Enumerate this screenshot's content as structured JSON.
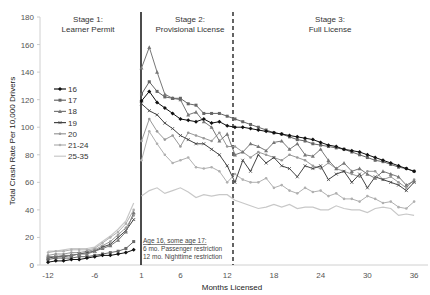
{
  "chart_data": {
    "type": "line",
    "title": "",
    "xlabel": "Months Licensed",
    "ylabel": "Total Crash Rate Per 10,000 Drivers",
    "ylim": [
      0,
      180
    ],
    "yticks": [
      0,
      20,
      40,
      60,
      80,
      100,
      120,
      140,
      160,
      180
    ],
    "xtick_labels": [
      "-12",
      "-6",
      "1",
      "6",
      "12",
      "18",
      "24",
      "30",
      "36"
    ],
    "grid": false,
    "legend_position": "upper-left-inside",
    "x": [
      -12,
      -11,
      -10,
      -9,
      -8,
      -7,
      -6,
      -5,
      -4,
      -3,
      -2,
      -1,
      1,
      2,
      3,
      4,
      5,
      6,
      7,
      8,
      9,
      10,
      11,
      12,
      13,
      14,
      15,
      16,
      17,
      18,
      19,
      20,
      21,
      22,
      23,
      24,
      25,
      26,
      27,
      28,
      29,
      30,
      31,
      32,
      33,
      34,
      35,
      36
    ],
    "stages": [
      {
        "label_line1": "Stage 1:",
        "label_line2": "Learner Permit"
      },
      {
        "label_line1": "Stage 2:",
        "label_line2": "Provisional License"
      },
      {
        "label_line1": "Stage 3:",
        "label_line2": "Full License"
      }
    ],
    "annotation": {
      "line1": "Age 16, some age 17:",
      "line2": "6 mo. Passenger restriction",
      "line3": "12 mo. Nighttime restriction"
    },
    "series": [
      {
        "name": "16",
        "color": "#111111",
        "marker": "diamond",
        "values": [
          2,
          3,
          3,
          4,
          4,
          5,
          6,
          7,
          7,
          8,
          9,
          11,
          119,
          126,
          118,
          114,
          110,
          106,
          105,
          104,
          106,
          103,
          104,
          101,
          100,
          100,
          99,
          98,
          97,
          96,
          95,
          94,
          93,
          92,
          91,
          89,
          87,
          86,
          84,
          83,
          82,
          80,
          78,
          76,
          74,
          72,
          70,
          68
        ]
      },
      {
        "name": "17",
        "color": "#666666",
        "marker": "square",
        "values": [
          4,
          5,
          5,
          5,
          6,
          6,
          7,
          8,
          9,
          10,
          12,
          17,
          124,
          133,
          126,
          122,
          121,
          121,
          117,
          116,
          110,
          110,
          110,
          108,
          106,
          104,
          102,
          100,
          98,
          96,
          95,
          93,
          91,
          90,
          88,
          87,
          86,
          85,
          84,
          82,
          80,
          78,
          76,
          75,
          73,
          71,
          70,
          68
        ]
      },
      {
        "name": "18",
        "color": "#777777",
        "marker": "triangle",
        "values": [
          6,
          6,
          7,
          7,
          8,
          8,
          10,
          12,
          14,
          18,
          24,
          38,
          143,
          158,
          140,
          124,
          121,
          120,
          109,
          111,
          104,
          100,
          90,
          95,
          80,
          82,
          88,
          86,
          83,
          89,
          90,
          84,
          88,
          80,
          79,
          84,
          76,
          70,
          74,
          68,
          70,
          66,
          63,
          68,
          66,
          64,
          58,
          61
        ]
      },
      {
        "name": "19",
        "color": "#444444",
        "marker": "x",
        "values": [
          5,
          6,
          6,
          7,
          8,
          9,
          10,
          13,
          15,
          20,
          25,
          33,
          117,
          112,
          109,
          103,
          99,
          94,
          91,
          88,
          88,
          84,
          80,
          72,
          60,
          76,
          68,
          80,
          74,
          78,
          72,
          70,
          64,
          72,
          70,
          72,
          62,
          66,
          68,
          60,
          66,
          56,
          64,
          62,
          60,
          58,
          54,
          60
        ]
      },
      {
        "name": "20",
        "color": "#999999",
        "marker": "circle",
        "values": [
          7,
          8,
          8,
          9,
          9,
          10,
          11,
          14,
          17,
          22,
          27,
          36,
          90,
          106,
          97,
          91,
          94,
          86,
          96,
          94,
          92,
          90,
          96,
          86,
          86,
          82,
          78,
          82,
          80,
          78,
          76,
          80,
          78,
          76,
          72,
          70,
          74,
          70,
          68,
          66,
          64,
          68,
          68,
          62,
          64,
          60,
          56,
          62
        ]
      },
      {
        "name": "21-24",
        "color": "#b0b0b0",
        "marker": "circle",
        "values": [
          9,
          10,
          10,
          11,
          11,
          11,
          12,
          16,
          20,
          24,
          30,
          40,
          76,
          97,
          88,
          80,
          74,
          76,
          78,
          71,
          70,
          71,
          68,
          60,
          66,
          62,
          60,
          60,
          63,
          56,
          58,
          54,
          52,
          56,
          53,
          54,
          50,
          52,
          48,
          48,
          46,
          50,
          48,
          45,
          46,
          42,
          41,
          46
        ]
      },
      {
        "name": "25-35",
        "color": "#c8c8c8",
        "marker": "none",
        "values": [
          10,
          10,
          11,
          12,
          12,
          12,
          13,
          17,
          21,
          26,
          32,
          45,
          50,
          54,
          56,
          52,
          54,
          56,
          53,
          49,
          51,
          50,
          51,
          51,
          47,
          45,
          43,
          41,
          42,
          44,
          42,
          44,
          41,
          42,
          42,
          40,
          40,
          43,
          41,
          40,
          40,
          38,
          41,
          42,
          41,
          36,
          37,
          36
        ]
      }
    ]
  }
}
